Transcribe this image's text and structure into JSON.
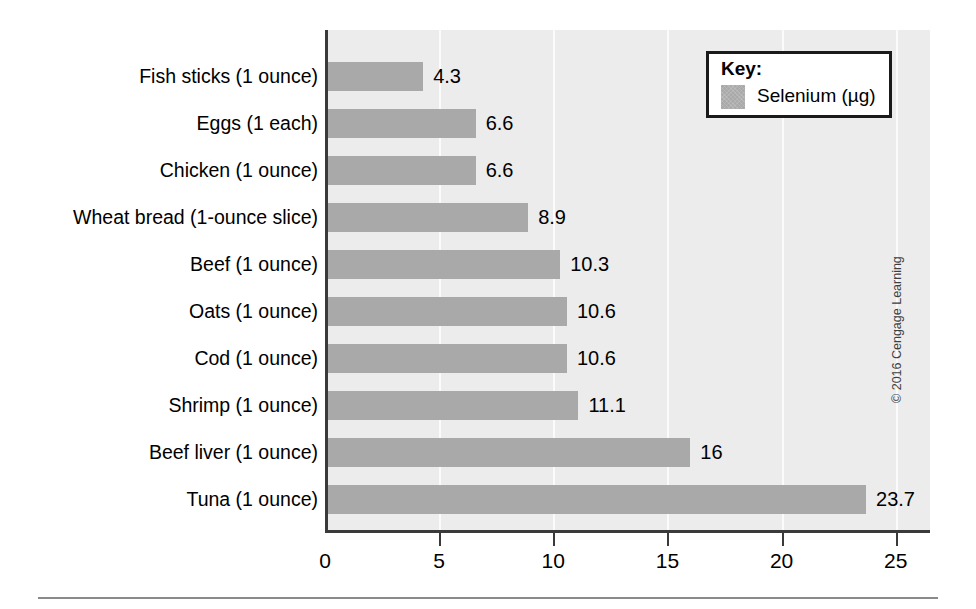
{
  "chart_data": {
    "type": "bar",
    "orientation": "horizontal",
    "title": "",
    "xlabel": "",
    "ylabel": "",
    "xlim": [
      0,
      26.5
    ],
    "xticks": [
      0,
      5,
      10,
      15,
      20,
      25
    ],
    "xtick_labels": [
      "0",
      "5",
      "10",
      "15",
      "20",
      "25"
    ],
    "grid": true,
    "grid_axis": "x",
    "legend_position": "top-right",
    "categories": [
      "Fish sticks (1 ounce)",
      "Eggs (1 each)",
      "Chicken (1 ounce)",
      "Wheat bread (1-ounce slice)",
      "Beef (1 ounce)",
      "Oats (1 ounce)",
      "Cod (1 ounce)",
      "Shrimp (1 ounce)",
      "Beef liver (1 ounce)",
      "Tuna (1 ounce)"
    ],
    "values": [
      4.3,
      6.6,
      6.6,
      8.9,
      10.3,
      10.6,
      10.6,
      11.1,
      16,
      23.7
    ],
    "value_labels": [
      "4.3",
      "6.6",
      "6.6",
      "8.9",
      "10.3",
      "10.6",
      "10.6",
      "11.1",
      "16",
      "23.7"
    ],
    "series": [
      {
        "name": "Selenium (µg)",
        "color": "#a9a9a9",
        "values": [
          4.3,
          6.6,
          6.6,
          8.9,
          10.3,
          10.6,
          10.6,
          11.1,
          16,
          23.7
        ]
      }
    ]
  },
  "legend": {
    "title": "Key:",
    "entry_label": "Selenium (µg)",
    "swatch_color": "#a9a9a9"
  },
  "credit": {
    "text": "© 2016 Cengage Learning"
  },
  "colors": {
    "bar": "#a9a9a9",
    "plot_background": "#ececec",
    "gridline": "#fbfbfb",
    "axis": "#3a3a3a",
    "text": "#000000"
  }
}
